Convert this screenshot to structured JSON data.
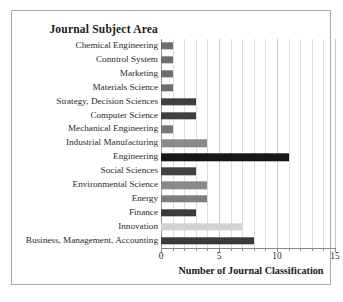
{
  "chart_data": {
    "type": "bar",
    "orientation": "horizontal",
    "title": "Journal Subject Area",
    "xlabel": "Number of Journal Classification",
    "ylabel": "",
    "xlim": [
      0,
      15
    ],
    "xticks": [
      "0",
      "5",
      "10",
      "15"
    ],
    "xtick_values": [
      0,
      5,
      10,
      15
    ],
    "minor_gridlines": true,
    "grid": true,
    "legend": "none",
    "categories": [
      "Chemical Engineering",
      "Conntrol System",
      "Marketing",
      "Materials Science",
      "Strategy, Decision Sciences",
      "Computer Science",
      "Mechanical Engineering",
      "Industrial Manufacturing",
      "Engineering",
      "Social Sciences",
      "Environmental Science",
      "Energy",
      "Finance",
      "Innovation",
      "Business, Management, Accounting"
    ],
    "values": [
      1,
      1,
      1,
      1,
      3,
      3,
      1,
      4,
      11,
      3,
      4,
      4,
      3,
      7,
      8
    ],
    "bar_colors": [
      "#6e6e6e",
      "#6e6e6e",
      "#6e6e6e",
      "#6e6e6e",
      "#3f3f3f",
      "#3f3f3f",
      "#777777",
      "#8a8a8a",
      "#171717",
      "#424242",
      "#8a8a8a",
      "#7e7e7e",
      "#3c3c3c",
      "#d2d2d2",
      "#3a3a3a"
    ]
  },
  "colors": {
    "frame_border": "#a9a9a9",
    "gridline": "#dcdcdc",
    "axis_line": "#8a8a8a",
    "text": "#2b2b2b",
    "background": "#ffffff"
  }
}
